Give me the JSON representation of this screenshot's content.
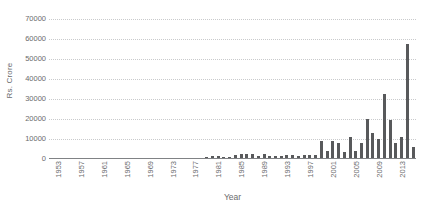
{
  "chart_data": {
    "type": "bar",
    "title": "",
    "xlabel": "Year",
    "ylabel": "Rs. Crore",
    "ylim": [
      0,
      70000
    ],
    "y_ticks": [
      0,
      10000,
      20000,
      30000,
      40000,
      50000,
      60000,
      70000
    ],
    "y_tick_labels": [
      "0",
      "10000",
      "20000",
      "30000",
      "40000",
      "50000",
      "60000",
      "70000"
    ],
    "grid": true,
    "legend": null,
    "x_tick_labels": [
      "1953",
      "1957",
      "1961",
      "1965",
      "1969",
      "1973",
      "1977",
      "1981",
      "1985",
      "1989",
      "1993",
      "1997",
      "2001",
      "2005",
      "2009",
      "2013"
    ],
    "x_tick_step": 4,
    "bar_color": "#58595b",
    "grid_color": "#c9cacc",
    "axis_color": "#808285",
    "text_color": "#6a6b6d",
    "categories": [
      "1953",
      "1954",
      "1955",
      "1956",
      "1957",
      "1958",
      "1959",
      "1960",
      "1961",
      "1962",
      "1963",
      "1964",
      "1965",
      "1966",
      "1967",
      "1968",
      "1969",
      "1970",
      "1971",
      "1972",
      "1973",
      "1974",
      "1975",
      "1976",
      "1977",
      "1978",
      "1979",
      "1980",
      "1981",
      "1982",
      "1983",
      "1984",
      "1985",
      "1986",
      "1987",
      "1988",
      "1989",
      "1990",
      "1991",
      "1992",
      "1993",
      "1994",
      "1995",
      "1996",
      "1997",
      "1998",
      "1999",
      "2000",
      "2001",
      "2002",
      "2003",
      "2004",
      "2005",
      "2006",
      "2007",
      "2008",
      "2009",
      "2010",
      "2011",
      "2012",
      "2013",
      "2014",
      "2015",
      "2016"
    ],
    "values": [
      0,
      0,
      0,
      0,
      0,
      0,
      0,
      0,
      0,
      0,
      0,
      0,
      0,
      0,
      100,
      150,
      300,
      200,
      120,
      120,
      150,
      250,
      300,
      350,
      600,
      700,
      700,
      900,
      1300,
      1300,
      900,
      1100,
      1900,
      2300,
      2400,
      2400,
      1500,
      2500,
      1500,
      1300,
      1400,
      2000,
      2200,
      1500,
      2200,
      2200,
      2200,
      9100,
      3900,
      8800,
      7800,
      3300,
      11200,
      3900,
      7900,
      19900,
      13200,
      9800,
      32400,
      19400,
      8200,
      11100,
      47200,
      15300
    ],
    "notable_points": [
      {
        "year": "2015",
        "value": 57300
      },
      {
        "year": "2016",
        "value": 6200
      }
    ]
  }
}
